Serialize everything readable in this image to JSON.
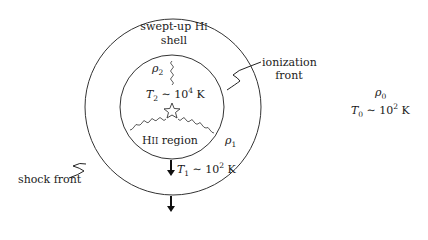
{
  "diagram": {
    "type": "HII region expansion schematic",
    "shell_label": {
      "line1": "swept-up H",
      "roman": "I",
      "line2": "shell"
    },
    "ionization_front_label": {
      "line1": "ionization",
      "line2": "front"
    },
    "shock_front_label": "shock front",
    "hii_region_label": {
      "prefix": "H",
      "roman": "II",
      "suffix": " region"
    },
    "inner_region": {
      "density": {
        "symbol": "ρ",
        "sub": "2"
      },
      "temperature": {
        "symbol": "T",
        "sub": "2",
        "rel": " ∼ 10",
        "exp": "4",
        "unit": " K"
      }
    },
    "shell_region": {
      "density": {
        "symbol": "ρ",
        "sub": "1"
      },
      "temperature": {
        "symbol": "T",
        "sub": "1",
        "rel": " ∼ 10",
        "exp": "2",
        "unit": " K"
      }
    },
    "ambient_medium": {
      "density": {
        "symbol": "ρ",
        "sub": "0"
      },
      "temperature": {
        "symbol": "T",
        "sub": "0",
        "rel": " ∼ 10",
        "exp": "2",
        "unit": " K"
      }
    },
    "star_icon": "star-outline",
    "line_color": "#333333"
  }
}
